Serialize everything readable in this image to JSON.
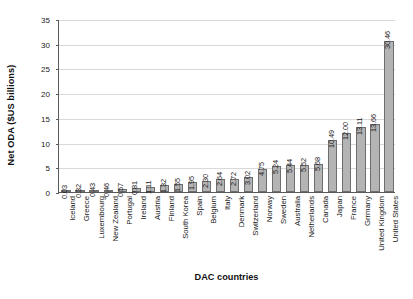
{
  "chart_data": {
    "type": "bar",
    "title": "",
    "xlabel": "DAC countries",
    "ylabel": "Net ODA ($US billions)",
    "ylim": [
      0,
      35
    ],
    "yticks": [
      0,
      5,
      10,
      15,
      20,
      25,
      30,
      35
    ],
    "ytick_labels": [
      "0",
      "5",
      "10",
      "15",
      "20",
      "25",
      "30",
      "35"
    ],
    "grid": true,
    "legend": "none",
    "bar_color": "#b4b4b4",
    "bar_border_color": "#6e6e6e",
    "gridline_color": "#d9d9d9",
    "axis_color": "#5a5a5a",
    "categories": [
      "Iceland",
      "Greece",
      "Luxembourg",
      "New Zealand",
      "Portugal",
      "Ireland",
      "Austria",
      "Finland",
      "South Korea",
      "Spain",
      "Belgium",
      "Italy",
      "Denmark",
      "Switzerland",
      "Norway",
      "Sweden",
      "Australia",
      "Netherlands",
      "Canada",
      "Japan",
      "France",
      "Grrmany",
      "United Kingdom",
      "United States"
    ],
    "values": [
      0.03,
      0.32,
      0.43,
      0.46,
      0.57,
      0.81,
      1.11,
      1.32,
      1.55,
      1.95,
      2.3,
      2.64,
      2.72,
      3.02,
      4.75,
      5.24,
      5.44,
      5.52,
      5.68,
      10.49,
      12.0,
      13.11,
      13.66,
      30.46
    ],
    "value_labels": [
      "0.03",
      "0.32",
      "0.43",
      "0.46",
      "0.57",
      "0.81",
      "1.11",
      "1.32",
      "1.55",
      "1.95",
      "2.30",
      "2.64",
      "2.72",
      "3.02",
      "4.75",
      "5.24",
      "5.44",
      "5.52",
      "5.68",
      "10.49",
      "12.00",
      "13.11",
      "13.66",
      "30.46"
    ]
  }
}
